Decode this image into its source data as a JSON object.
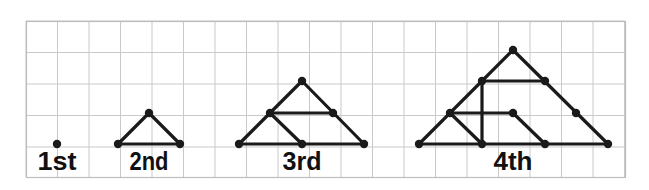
{
  "figure": {
    "background_color": "#ffffff",
    "grid": {
      "visible": true,
      "x": 26,
      "y": 21,
      "width": 599,
      "height": 156,
      "cell_size": 31.5,
      "line_color": "#c9c9c9",
      "border_color": "#bdbdbd",
      "cols": 19,
      "rows": 5
    },
    "style": {
      "edge_color": "#1a1a1a",
      "edge_width": 3.2,
      "node_color": "#1a1a1a",
      "node_radius": 4.2,
      "label_color": "#111111",
      "label_font_size": 25
    },
    "baseline_y": 144,
    "label_y": 170,
    "steps": [
      {
        "id": "step-1",
        "label": "1st",
        "label_x": 57,
        "rows_of_dots": 1,
        "dot_count": 1,
        "nodes": [
          {
            "name": "n0",
            "x": 57,
            "y": 144
          }
        ],
        "edges": []
      },
      {
        "id": "step-2",
        "label": "2nd",
        "label_x": 149,
        "rows_of_dots": 2,
        "dot_count": 3,
        "nodes": [
          {
            "name": "apex",
            "x": 149,
            "y": 113
          },
          {
            "name": "base-left",
            "x": 118,
            "y": 144
          },
          {
            "name": "base-right",
            "x": 180,
            "y": 144
          }
        ],
        "edges": [
          {
            "from": "base-left",
            "to": "apex"
          },
          {
            "from": "apex",
            "to": "base-right"
          },
          {
            "from": "base-left",
            "to": "base-right"
          }
        ]
      },
      {
        "id": "step-3",
        "label": "3rd",
        "label_x": 302,
        "rows_of_dots": 3,
        "dot_count": 6,
        "nodes": [
          {
            "name": "apex",
            "x": 302,
            "y": 81
          },
          {
            "name": "mid-left",
            "x": 270,
            "y": 113
          },
          {
            "name": "mid-right",
            "x": 333,
            "y": 113
          },
          {
            "name": "base-left",
            "x": 239,
            "y": 144
          },
          {
            "name": "base-mid",
            "x": 302,
            "y": 144
          },
          {
            "name": "base-right",
            "x": 364,
            "y": 144
          }
        ],
        "edges": [
          {
            "from": "base-left",
            "to": "apex"
          },
          {
            "from": "apex",
            "to": "base-right"
          },
          {
            "from": "base-left",
            "to": "base-right"
          },
          {
            "from": "mid-left",
            "to": "base-mid"
          },
          {
            "from": "mid-left",
            "to": "mid-right"
          }
        ]
      },
      {
        "id": "step-4",
        "label": "4th",
        "label_x": 513,
        "rows_of_dots": 4,
        "dot_count": 10,
        "nodes": [
          {
            "name": "apex",
            "x": 513,
            "y": 50
          },
          {
            "name": "r2-left",
            "x": 482,
            "y": 81
          },
          {
            "name": "r2-right",
            "x": 545,
            "y": 81
          },
          {
            "name": "r3-left",
            "x": 450,
            "y": 113
          },
          {
            "name": "r3-mid",
            "x": 513,
            "y": 113
          },
          {
            "name": "r3-right",
            "x": 576,
            "y": 113
          },
          {
            "name": "base-left",
            "x": 419,
            "y": 144
          },
          {
            "name": "base-m1",
            "x": 482,
            "y": 144
          },
          {
            "name": "base-m2",
            "x": 545,
            "y": 144
          },
          {
            "name": "base-right",
            "x": 608,
            "y": 144
          }
        ],
        "edges": [
          {
            "from": "base-left",
            "to": "apex"
          },
          {
            "from": "apex",
            "to": "base-right"
          },
          {
            "from": "base-left",
            "to": "base-right"
          },
          {
            "from": "r2-left",
            "to": "base-m1"
          },
          {
            "from": "r2-left",
            "to": "r2-right"
          },
          {
            "from": "r3-left",
            "to": "base-m1"
          },
          {
            "from": "r3-left",
            "to": "r3-mid"
          },
          {
            "from": "r3-mid",
            "to": "base-m2"
          }
        ]
      }
    ]
  }
}
